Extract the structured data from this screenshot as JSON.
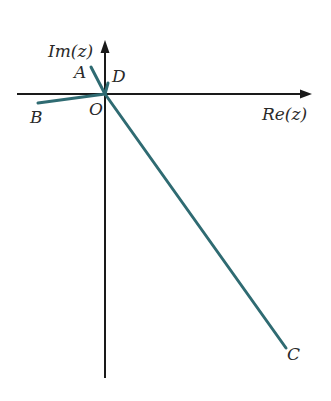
{
  "diagram": {
    "axes": {
      "x_label": "Re(z)",
      "y_label": "Im(z)",
      "origin_label": "O",
      "color": "#1a1a1a"
    },
    "points": [
      {
        "label": "A",
        "x1": 105,
        "y1": 94,
        "x2": 91,
        "y2": 67
      },
      {
        "label": "B",
        "x1": 105,
        "y1": 94,
        "x2": 38,
        "y2": 102
      },
      {
        "label": "C",
        "x1": 105,
        "y1": 94,
        "x2": 287,
        "y2": 348
      },
      {
        "label": "D",
        "x1": 105,
        "y1": 94,
        "x2": 108,
        "y2": 84
      }
    ],
    "segment_color": "#2f6b72"
  }
}
